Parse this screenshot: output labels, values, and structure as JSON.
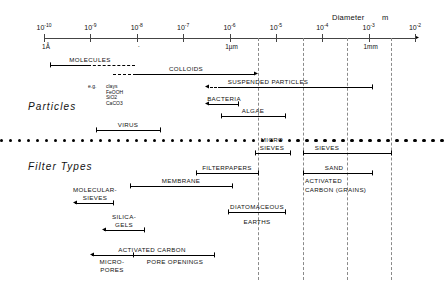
{
  "figure": {
    "axis": {
      "quantity_label": "Diameter",
      "unit_label": "m",
      "ticks": [
        {
          "label": "10",
          "exp": "-10",
          "under": "1Å"
        },
        {
          "label": "10",
          "exp": "-9",
          "under": ""
        },
        {
          "label": "10",
          "exp": "-8",
          "under": "·"
        },
        {
          "label": "10",
          "exp": "-7",
          "under": ""
        },
        {
          "label": "10",
          "exp": "-6",
          "under": "1µm"
        },
        {
          "label": "10",
          "exp": "-5",
          "under": ""
        },
        {
          "label": "10",
          "exp": "-4",
          "under": ""
        },
        {
          "label": "10",
          "exp": "-3",
          "under": "1mm"
        },
        {
          "label": "10",
          "exp": "-2",
          "under": ""
        }
      ]
    },
    "sections": [
      {
        "title": "Particles"
      },
      {
        "title": "Filter Types"
      }
    ],
    "example_note": {
      "prefix": "e.g.",
      "items": [
        "clays",
        "FeOOH",
        "SiO2",
        "CaCO3"
      ]
    },
    "particle_bands": [
      {
        "name": "MOLECULES",
        "label": "MOLECULES"
      },
      {
        "name": "COLLOIDS",
        "label": "COLLOIDS"
      },
      {
        "name": "SUSPENDED PARTICLES",
        "label": "SUSPENDED   PARTICLES"
      },
      {
        "name": "BACTERIA",
        "label": "BACTERIA"
      },
      {
        "name": "ALGAE",
        "label": "ALGAE"
      },
      {
        "name": "VIRUS",
        "label": "VIRUS"
      }
    ],
    "filter_bands": [
      {
        "name": "MOLECULAR-SIEVES",
        "label_line1": "MOLECULAR-",
        "label_line2": "SIEVES"
      },
      {
        "name": "SILICA-GELS",
        "label_line1": "SILICA-",
        "label_line2": "GELS"
      },
      {
        "name": "MEMBRANE",
        "label_line1": "MEMBRANE",
        "label_line2": ""
      },
      {
        "name": "FILTERPAPERS",
        "label_line1": "FILTERPAPERS",
        "label_line2": ""
      },
      {
        "name": "DIATOMACEOUS EARTHS",
        "label_line1": "DIATOMACEOUS",
        "label_line2": "EARTHS"
      },
      {
        "name": "MICRO-SIEVES",
        "label_line1": "MICRO",
        "label_line2": "SIEVES"
      },
      {
        "name": "SIEVES",
        "label_line1": "SIEVES",
        "label_line2": ""
      },
      {
        "name": "SAND",
        "label_line1": "SAND",
        "label_line2": ""
      },
      {
        "name": "ACTIVATED CARBON GRAINS",
        "label_line1": "ACTIVATED",
        "label_line2": "CARBON   (GRAINS)"
      },
      {
        "name": "ACTIVATED CARBON",
        "label_line1": "ACTIVATED   CARBON",
        "label_line2": ""
      },
      {
        "name": "MICRO-PORES",
        "label_line1": "MICRO-",
        "label_line2": "PORES"
      },
      {
        "name": "PORE OPENINGS",
        "label_line1": "PORE  OPENINGS",
        "label_line2": ""
      }
    ],
    "colors": {
      "ink": "#111111",
      "axis": "#444444",
      "guide": "#8a8a8a",
      "background": "#ffffff"
    }
  }
}
